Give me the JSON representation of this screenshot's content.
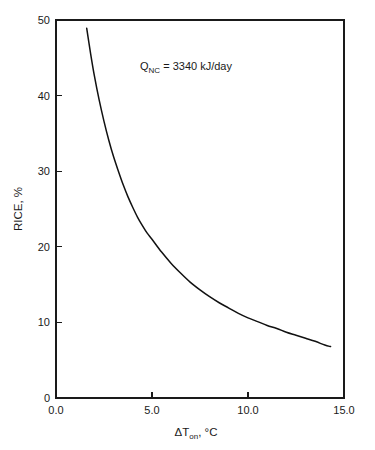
{
  "chart_data": {
    "type": "line",
    "title": "",
    "subtitle": "",
    "xlabel": "ΔT",
    "xlabel_sub": "on",
    "xlabel_tail": ", °C",
    "xlabel_full": "ΔTon, °C",
    "ylabel_full": "RICE, %",
    "ylabel_main": "RICE, %",
    "xlim": [
      0.0,
      15.0
    ],
    "ylim": [
      0,
      50
    ],
    "grid": false,
    "legend": "none",
    "xticks": [
      0.0,
      5.0,
      10.0,
      15.0
    ],
    "xtick_labels": [
      "0.0",
      "5.0",
      "10.0",
      "15.0"
    ],
    "yticks": [
      0,
      10,
      20,
      30,
      40,
      50
    ],
    "ytick_labels": [
      "0",
      "10",
      "20",
      "30",
      "40",
      "50"
    ],
    "annotations": [
      {
        "id": "qnc-annotation",
        "text_main": "Q",
        "text_sub": "NC",
        "text_tail": " = 3340 kJ/day",
        "text_full": "QNC = 3340 kJ/day",
        "x": 4.4,
        "y": 44.3
      }
    ],
    "series": [
      {
        "name": "RICE vs ΔTon",
        "color": "#111111",
        "x": [
          1.6,
          1.8,
          2.0,
          2.25,
          2.5,
          2.75,
          3.0,
          3.25,
          3.5,
          3.75,
          4.0,
          4.25,
          4.5,
          4.75,
          5.0,
          5.5,
          6.0,
          6.5,
          7.0,
          7.5,
          8.0,
          8.5,
          9.0,
          9.5,
          10.0,
          10.5,
          11.0,
          11.5,
          12.0,
          12.5,
          13.0,
          13.5,
          14.0,
          14.3
        ],
        "y": [
          48.9,
          45.6,
          42.6,
          39.4,
          36.6,
          34.1,
          31.9,
          30.0,
          28.2,
          26.6,
          25.2,
          23.9,
          22.8,
          21.8,
          21.0,
          19.3,
          17.8,
          16.5,
          15.3,
          14.3,
          13.4,
          12.6,
          11.9,
          11.2,
          10.6,
          10.1,
          9.6,
          9.2,
          8.7,
          8.3,
          7.9,
          7.5,
          7.0,
          6.8
        ]
      }
    ]
  },
  "figure": {
    "background_color": "#ffffff",
    "line_color": "#111111",
    "text_color": "#1a1a1a"
  }
}
